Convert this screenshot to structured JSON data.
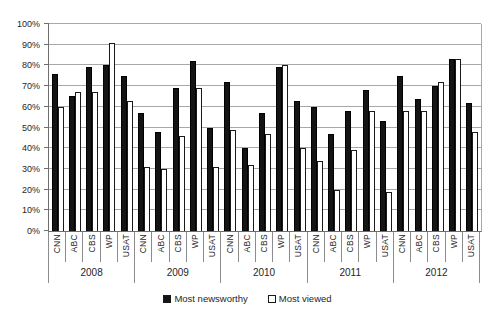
{
  "chart_data": {
    "type": "bar",
    "title": "",
    "groups": [
      "2008",
      "2009",
      "2010",
      "2011",
      "2012"
    ],
    "categories": [
      "CNN",
      "ABC",
      "CBS",
      "WP",
      "USAT"
    ],
    "series": [
      {
        "name": "Most newsworthy",
        "fill": "#141414",
        "values": [
          [
            76,
            65,
            79,
            80,
            75
          ],
          [
            57,
            48,
            69,
            82,
            50
          ],
          [
            72,
            40,
            57,
            79,
            63
          ],
          [
            60,
            47,
            58,
            68,
            53
          ],
          [
            75,
            64,
            70,
            83,
            62
          ]
        ]
      },
      {
        "name": "Most viewed",
        "fill": "#ffffff",
        "values": [
          [
            60,
            67,
            67,
            91,
            63
          ],
          [
            31,
            30,
            46,
            69,
            31
          ],
          [
            49,
            32,
            47,
            80,
            40
          ],
          [
            34,
            20,
            39,
            58,
            19
          ],
          [
            58,
            58,
            72,
            83,
            48
          ]
        ]
      }
    ],
    "y_axis": {
      "min": 0,
      "max": 100,
      "step": 10,
      "tick_labels": [
        "0%",
        "10%",
        "20%",
        "30%",
        "40%",
        "50%",
        "60%",
        "70%",
        "80%",
        "90%",
        "100%"
      ]
    },
    "grid": true,
    "legend_position": "bottom"
  }
}
